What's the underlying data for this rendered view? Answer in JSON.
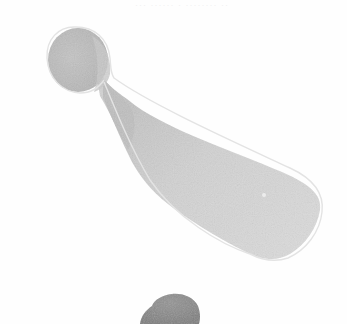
{
  "artwork": {
    "subject": "bowling-pin shaped watercolor blot",
    "medium": "watercolor on paper",
    "colors": {
      "paper": "#fefefe",
      "wash_light": "#d9d9d9",
      "wash_mid": "#c6c6c6",
      "wash_dark": "#a8a8a8",
      "outline": "#e2e2e2",
      "bottom_blot": "#8e8e8e"
    }
  },
  "show_through_text": "··· ······ · ········ ··"
}
